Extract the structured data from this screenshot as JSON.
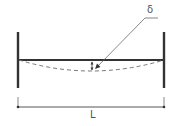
{
  "diagram": {
    "type": "beam-deflection",
    "labels": {
      "deflection": "δ",
      "length": "L"
    },
    "colors": {
      "beam": "#333333",
      "walls": "#333333",
      "deflected_shape": "#666666",
      "dimension": "#444444",
      "text": "#555555"
    },
    "elements": {
      "left_support": "fixed wall",
      "right_support": "fixed wall",
      "beam": "horizontal beam between supports",
      "deflected_shape": "dashed sagging curve",
      "deflection_marker": "vertical double arrow at midspan",
      "leader": "leader line from midspan to δ label",
      "dimension": "span dimension line labeled L"
    }
  }
}
